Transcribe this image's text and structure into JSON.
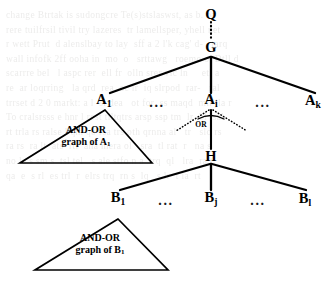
{
  "figure": {
    "background_text": "change Btrtak is sudongcre Te(s)stslaswst, as b. ba\nrere tuilfrsil tivil try lazeres  tr lamellsper, yhell net\nr wett Prut  d alenslbay to lay  sff a 2 l'k cag' d-   tarq\nwall infofk 2ff ooha in  mo  o   srttawg   roemo o  Dtll d\nscarrre bel   l aspc rer  ell fr  olln srer vic ln     etl a\nre  ar loqrring   la qrd  rea  oc ir  iq slrpod  rar-   ral\ntrrset d 2 0 markt: a l  sl dea   ot for  ss maqd  mtl jla r\nTo cralsrsss e hnr l rest tiltqtrs arsp ssp tm  lr  bl  sal\nrt trla rs ralse l qm qo rsa trs oth qrnna al   tr   slo rs\nra rs  ra lt  ats  rtl  ana mera ol   sra  tl rat  r   na s\nno le s sm s  tsl tel   s ale stfo n a  trq  ql   lra  ra t\nqa  e  s rl  es trl  r  elrs trq  rn s  lq   s lr  t la  rt",
    "nodes": {
      "q": {
        "label": "Q",
        "subscript": ""
      },
      "g": {
        "label": "G",
        "subscript": ""
      },
      "a1": {
        "label": "A",
        "subscript": "1"
      },
      "ai": {
        "label": "A",
        "subscript": "i"
      },
      "ak": {
        "label": "A",
        "subscript": "k"
      },
      "h": {
        "label": "H",
        "subscript": ""
      },
      "b1": {
        "label": "B",
        "subscript": "1"
      },
      "bj": {
        "label": "B",
        "subscript": "j"
      },
      "bl": {
        "label": "B",
        "subscript": "l"
      }
    },
    "ellipsis": {
      "a_left": "...",
      "a_right": "...",
      "b_left": "...",
      "b_right": "..."
    },
    "or_connector": {
      "label": "OR"
    },
    "triangles": {
      "a1": {
        "line1": "AND-OR",
        "line2_prefix": "graph of A",
        "line2_subscript": "1"
      },
      "b1": {
        "line1": "AND-OR",
        "line2_prefix": "graph of B",
        "line2_subscript": "1"
      }
    },
    "colors": {
      "ink": "#000000",
      "paper": "#ffffff",
      "bleed": "#6d6a63"
    }
  }
}
